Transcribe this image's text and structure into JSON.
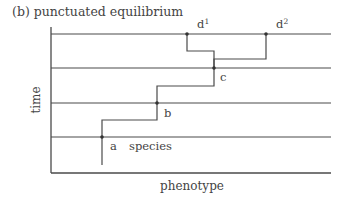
{
  "figure": {
    "title": "(b)  punctuated equilibrium",
    "y_axis_label": "time",
    "x_axis_label": "phenotype",
    "line_color": "#4a4a4a",
    "text_color": "#444444"
  },
  "time_levels": [
    34,
    68,
    103,
    137
  ],
  "nodes": [
    {
      "id": "a",
      "label": "a",
      "x": 102,
      "y": 137
    },
    {
      "id": "b",
      "label": "b",
      "x": 157,
      "y": 103
    },
    {
      "id": "c",
      "label": "c",
      "x": 214,
      "y": 68
    },
    {
      "id": "d1",
      "label": "d",
      "sup": "1",
      "x": 187,
      "y": 34
    },
    {
      "id": "d2",
      "label": "d",
      "sup": "2",
      "x": 266,
      "y": 34
    }
  ],
  "annotations": {
    "species_label": "species"
  }
}
